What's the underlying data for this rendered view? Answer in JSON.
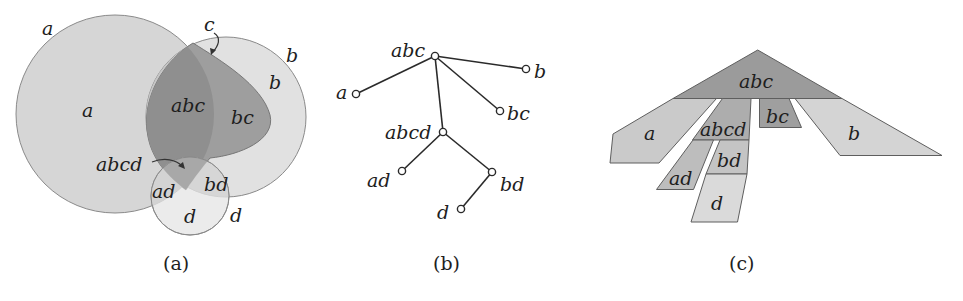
{
  "figure": {
    "panels": [
      {
        "id": "a",
        "caption": "(a)",
        "kind": "area-proportional Euler diagram",
        "sets": [
          {
            "name": "a",
            "shape": "circle"
          },
          {
            "name": "b",
            "shape": "circle"
          },
          {
            "name": "c",
            "shape": "teardrop"
          },
          {
            "name": "d",
            "shape": "circle"
          }
        ],
        "outer_labels": {
          "a": "a",
          "b": "b",
          "c": "c",
          "d": "d"
        },
        "zone_labels": {
          "a": "a",
          "b": "b",
          "abc": "abc",
          "bc": "bc",
          "abcd": "abcd",
          "ad": "ad",
          "bd": "bd",
          "d": "d"
        }
      },
      {
        "id": "b",
        "caption": "(b)",
        "kind": "zone tree",
        "nodes": [
          "abc",
          "a",
          "b",
          "bc",
          "abcd",
          "ad",
          "bd",
          "d"
        ],
        "node_labels": {
          "abc": "abc",
          "a": "a",
          "b": "b",
          "bc": "bc",
          "abcd": "abcd",
          "ad": "ad",
          "bd": "bd",
          "d": "d"
        },
        "edges": [
          [
            "abc",
            "a"
          ],
          [
            "abc",
            "b"
          ],
          [
            "abc",
            "bc"
          ],
          [
            "abc",
            "abcd"
          ],
          [
            "abcd",
            "ad"
          ],
          [
            "abcd",
            "bd"
          ],
          [
            "bd",
            "d"
          ]
        ]
      },
      {
        "id": "c",
        "caption": "(c)",
        "kind": "tree drawn as polygon pieces",
        "piece_labels": {
          "abc": "abc",
          "a": "a",
          "abcd": "abcd",
          "bc": "bc",
          "b": "b",
          "ad": "ad",
          "bd": "bd",
          "d": "d"
        }
      }
    ],
    "colors": {
      "light_fill": "#d9d9d9",
      "mid_fill": "#bdbdbd",
      "dark_fill": "#9a9a9a",
      "darker_fill": "#8c8c8c",
      "stroke": "#6f6f6f",
      "edge": "#2a2a2a"
    }
  }
}
